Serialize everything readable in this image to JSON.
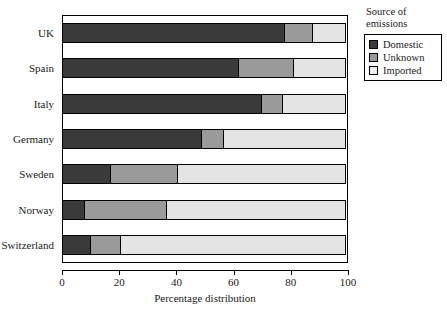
{
  "chart_data": {
    "type": "bar",
    "orientation": "horizontal",
    "stacked": true,
    "stack_total": 100,
    "title": "",
    "xlabel": "Percentage distribution",
    "ylabel": "",
    "xlim": [
      0,
      100
    ],
    "xticks": [
      0,
      20,
      40,
      60,
      80,
      100
    ],
    "xtick_labels": [
      "0",
      "20",
      "40",
      "60",
      "80",
      "100"
    ],
    "grid": false,
    "legend_position": "right",
    "legend_title": "Source of emissions",
    "categories": [
      "UK",
      "Spain",
      "Italy",
      "Germany",
      "Sweden",
      "Norway",
      "Switzerland"
    ],
    "series": [
      {
        "name": "Domestic",
        "color": "#3a3a3a",
        "values": [
          78,
          62,
          70,
          49,
          17,
          8,
          10
        ]
      },
      {
        "name": "Unknown",
        "color": "#9a9a9a",
        "values": [
          10,
          19.5,
          7.5,
          8,
          24,
          29,
          11
        ]
      },
      {
        "name": "Imported",
        "color": "#e4e4e4",
        "values": [
          12,
          18.5,
          22.5,
          43,
          59,
          63,
          79
        ]
      }
    ]
  },
  "axis": {
    "x_title": "Percentage distribution",
    "tick_labels": [
      "0",
      "20",
      "40",
      "60",
      "80",
      "100"
    ],
    "category_labels": [
      "UK",
      "Spain",
      "Italy",
      "Germany",
      "Sweden",
      "Norway",
      "Switzerland"
    ]
  },
  "legend": {
    "title_line_1": "Source of",
    "title_line_2": "emissions",
    "items": [
      {
        "label": "Domestic",
        "color": "#3a3a3a"
      },
      {
        "label": "Unknown",
        "color": "#9a9a9a"
      },
      {
        "label": "Imported",
        "color": "#eeeeee"
      }
    ]
  }
}
